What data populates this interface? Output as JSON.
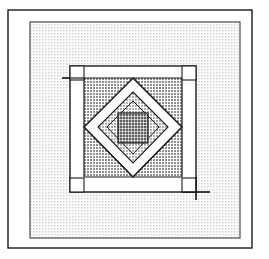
{
  "figure": {
    "kind": "line-drawing",
    "width": 269,
    "height": 259,
    "background_color": "#ffffff",
    "ink_color": "#1a1a1a",
    "render_style": "halftone-dot-screen-shading"
  },
  "palette": {
    "paper_white": "#ffffff",
    "panel_light_gray": "#e2e2e2",
    "block_medium_gray": "#a8a8a8",
    "inner_light_gray": "#b9b9b9",
    "center_dark_gray": "#7a7a7a",
    "line_black": "#1a1a1a",
    "line_thin_gray": "#555555"
  },
  "outer_frame": {
    "label": "outer-rule-rectangle",
    "x": 8,
    "y": 10,
    "width": 244,
    "height": 238,
    "stroke_width": 1.4
  },
  "background_panel": {
    "label": "stippled-background-panel",
    "x": 30,
    "y": 22,
    "width": 210,
    "height": 216,
    "fill": "#e2e2e2",
    "stroke_width": 1.2
  },
  "block": {
    "label": "quilt-block-outer-boundary",
    "x": 70,
    "y": 66,
    "width": 126,
    "height": 126,
    "stroke_width": 1.4,
    "sashing_fill": "#ffffff",
    "sashing_inset": 14
  },
  "block_body": {
    "label": "medium-gray-block-field",
    "x": 84,
    "y": 78,
    "width": 98,
    "height": 99,
    "fill": "#a8a8a8"
  },
  "sash_lines": [
    {
      "name": "sash-line-top",
      "x1": 84,
      "y1": 78,
      "x2": 182,
      "y2": 78
    },
    {
      "name": "sash-line-bottom",
      "x1": 84,
      "y1": 177,
      "x2": 182,
      "y2": 177
    },
    {
      "name": "sash-line-left",
      "x1": 84,
      "y1": 78,
      "x2": 84,
      "y2": 177
    },
    {
      "name": "sash-line-right",
      "x1": 182,
      "y1": 78,
      "x2": 182,
      "y2": 177
    }
  ],
  "overshoots": [
    {
      "name": "overshoot-top-left-horizontal",
      "x1": 62,
      "y1": 78,
      "x2": 84,
      "y2": 78
    },
    {
      "name": "overshoot-bottom-right-horizontal",
      "x1": 182,
      "y1": 192,
      "x2": 210,
      "y2": 192
    },
    {
      "name": "overshoot-bottom-right-vertical",
      "x1": 196,
      "y1": 177,
      "x2": 196,
      "y2": 200
    }
  ],
  "outer_diamond": {
    "label": "white-sash-diamond-outer",
    "fill": "#ffffff",
    "points": "133,78 182,127 133,177 84,127"
  },
  "inner_diamond": {
    "label": "light-gray-diamond-inner",
    "fill": "#b9b9b9",
    "points": "133,101 159,127 133,154 107,127"
  },
  "center_square": {
    "label": "dark-gray-center-square",
    "fill": "#7a7a7a",
    "x": 118,
    "y": 113,
    "width": 30,
    "height": 30
  },
  "corner_squares": [
    {
      "name": "corner-square-top-left",
      "x": 70,
      "y": 66,
      "size": 14
    },
    {
      "name": "corner-square-top-right",
      "x": 182,
      "y": 66,
      "size": 14
    },
    {
      "name": "corner-square-bottom-left",
      "x": 70,
      "y": 178,
      "size": 14
    },
    {
      "name": "corner-square-bottom-right",
      "x": 182,
      "y": 178,
      "size": 14
    }
  ],
  "chart_data": {
    "type": "table",
    "columns": [
      "region",
      "shape",
      "fill_tone",
      "x",
      "y",
      "width",
      "height"
    ],
    "rows": [
      [
        "outer frame",
        "rectangle",
        "none",
        8,
        10,
        244,
        238
      ],
      [
        "background panel",
        "rectangle",
        "light gray",
        30,
        22,
        210,
        216
      ],
      [
        "block boundary",
        "rectangle",
        "white sash",
        70,
        66,
        126,
        126
      ],
      [
        "block field",
        "rectangle",
        "medium gray",
        84,
        78,
        98,
        99
      ],
      [
        "outer diamond",
        "diamond",
        "white",
        84,
        78,
        98,
        99
      ],
      [
        "inner diamond",
        "diamond",
        "light gray",
        107,
        101,
        52,
        53
      ],
      [
        "center square",
        "rectangle",
        "dark gray",
        118,
        113,
        30,
        30
      ]
    ]
  }
}
